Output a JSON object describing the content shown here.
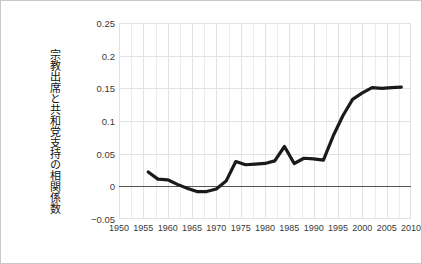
{
  "chart_data": {
    "type": "line",
    "title": "",
    "subtitle": "",
    "xlabel": "",
    "ylabel": "宗教出席と共和党支持の相関係数",
    "xlim": [
      1950,
      2010
    ],
    "ylim": [
      -0.05,
      0.25
    ],
    "xticks": [
      1950,
      1955,
      1960,
      1965,
      1970,
      1975,
      1980,
      1985,
      1990,
      1995,
      2000,
      2005,
      2010
    ],
    "xtick_labels": [
      "1950",
      "1955",
      "1960",
      "1965",
      "1970",
      "1975",
      "1980",
      "1985",
      "1990",
      "1995",
      "2000",
      "2005",
      "2010"
    ],
    "yticks": [
      -0.05,
      0,
      0.05,
      0.1,
      0.15,
      0.2,
      0.25
    ],
    "ytick_labels": [
      "−0.05",
      "0",
      "0.05",
      "0.1",
      "0.15",
      "0.2",
      "0.25"
    ],
    "grid": true,
    "grid_color": "#e2e2e6",
    "grid_minor": true,
    "zero_line": 0,
    "zero_line_color": "#555555",
    "legend": null,
    "legend_position": "none",
    "line_color": "#1a1a1a",
    "line_width": 3.2,
    "series": [
      {
        "name": "宗教出席と共和党支持の相関係数",
        "x": [
          1956,
          1958,
          1960,
          1962,
          1964,
          1966,
          1968,
          1970,
          1972,
          1974,
          1976,
          1978,
          1980,
          1982,
          1984,
          1986,
          1988,
          1990,
          1992,
          1994,
          1996,
          1998,
          2000,
          2002,
          2004,
          2006,
          2008
        ],
        "values": [
          0.022,
          0.011,
          0.01,
          0.003,
          -0.003,
          -0.008,
          -0.008,
          -0.004,
          0.008,
          0.038,
          0.033,
          0.034,
          0.035,
          0.039,
          0.061,
          0.035,
          0.043,
          0.042,
          0.04,
          0.077,
          0.108,
          0.133,
          0.143,
          0.151,
          0.15,
          0.151,
          0.152
        ]
      }
    ]
  },
  "figure": {
    "border_color": "#c8c8c8",
    "background": "#ffffff"
  }
}
